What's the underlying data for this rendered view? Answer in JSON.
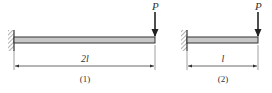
{
  "figures": [
    {
      "id": "1",
      "caption": "(1)",
      "load_label": "P",
      "length_label": "2l",
      "support": "fixed-wall-left",
      "geometry": {
        "wall_x": 14,
        "end_x": 155
      }
    },
    {
      "id": "2",
      "caption": "(2)",
      "load_label": "P",
      "length_label": "l",
      "support": "fixed-wall-left",
      "geometry": {
        "wall_x": 187,
        "end_x": 258
      }
    }
  ],
  "colors": {
    "line": "#333333",
    "beam_fill": "#c8c8c8",
    "hatch": "#555555",
    "background": "#ffffff"
  }
}
